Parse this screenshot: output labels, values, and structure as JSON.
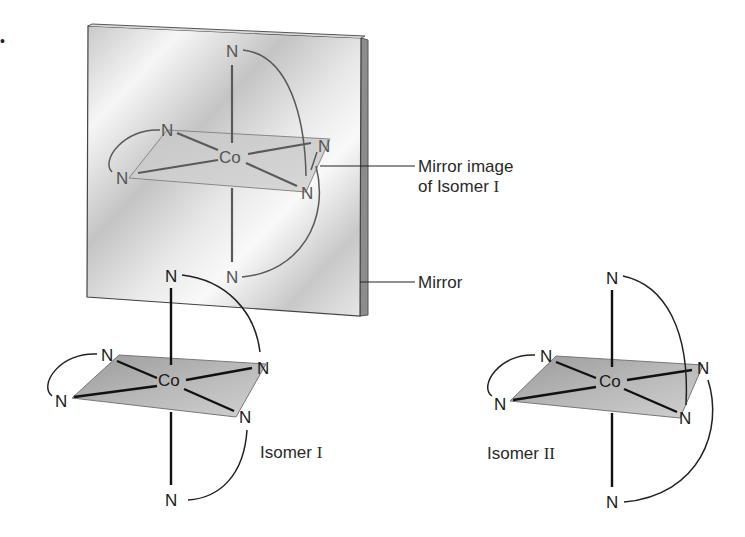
{
  "figure": {
    "bullet": "•",
    "colors": {
      "mirror_face_light": "#f4f4f4",
      "mirror_face_dark": "#bdbdbd",
      "mirror_edge": "#8a8a8a",
      "plane_fill": "#a8a8a8",
      "bond_fg": "#111111",
      "bond_mirror": "#5a5a5a"
    },
    "mirror_image": {
      "metal": "Co",
      "ligand_atoms": [
        "N",
        "N",
        "N",
        "N",
        "N",
        "N"
      ]
    },
    "isomer_1": {
      "metal": "Co",
      "ligand_atoms": [
        "N",
        "N",
        "N",
        "N",
        "N",
        "N"
      ],
      "label_prefix": "Isomer",
      "label_numeral": "I"
    },
    "isomer_2": {
      "metal": "Co",
      "ligand_atoms": [
        "N",
        "N",
        "N",
        "N",
        "N",
        "N"
      ],
      "label_prefix": "Isomer",
      "label_numeral": "II"
    },
    "callouts": {
      "mirror_image_line1": "Mirror image",
      "mirror_image_line2_prefix": "of Isomer",
      "mirror_image_line2_numeral": "I",
      "mirror": "Mirror"
    }
  }
}
